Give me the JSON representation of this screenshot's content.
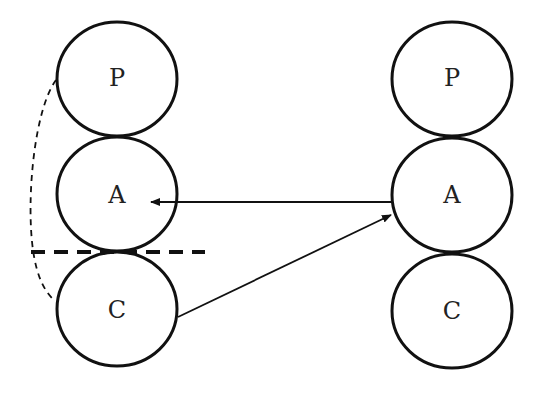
{
  "diagram": {
    "left_column": {
      "nodes": [
        {
          "label": "P",
          "cx": 117,
          "cy": 79
        },
        {
          "label": "A",
          "cx": 117,
          "cy": 196
        },
        {
          "label": "C",
          "cx": 117,
          "cy": 310
        }
      ]
    },
    "right_column": {
      "nodes": [
        {
          "label": "P",
          "cx": 452,
          "cy": 79
        },
        {
          "label": "A",
          "cx": 452,
          "cy": 195
        },
        {
          "label": "C",
          "cx": 452,
          "cy": 311
        }
      ]
    },
    "edges": [
      {
        "from": "right.A",
        "to": "left.A",
        "style": "solid-arrow"
      },
      {
        "from": "left.C",
        "to": "right.A",
        "style": "solid-arrow"
      },
      {
        "from": "left.P",
        "to": "left.C",
        "style": "dashed-curve"
      }
    ],
    "separator": {
      "style": "dashed-horizontal",
      "y": 252
    },
    "colors": {
      "stroke": "#111111",
      "background": "#ffffff"
    }
  }
}
